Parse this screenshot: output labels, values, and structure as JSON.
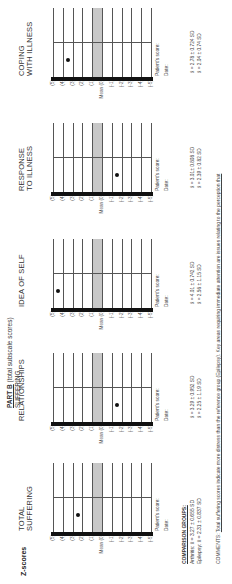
{
  "header": {
    "zscores_label": "Z-scores",
    "part_label": "PART B",
    "part_note": "(total subscale scores)",
    "section_label": "SUFFERING"
  },
  "scale": {
    "rows": [
      "(5)",
      "(4)",
      "(3)",
      "(2)",
      "(1)",
      "Mean (0)",
      "(-1)",
      "(-2)",
      "(-3)",
      "(-4)",
      "(-5)"
    ],
    "mean_highlight_color": "#c8c8c8"
  },
  "charts": [
    {
      "title1": "TOTAL",
      "title2": "SUFFERING",
      "patient_score_label": "Patient's score:",
      "date_label": "Date:",
      "dot_value": 2,
      "stat1": "",
      "stat2": ""
    },
    {
      "title1": "RELATIONSHIPS",
      "title2": "",
      "patient_score_label": "Patient's score:",
      "date_label": "Date:",
      "dot_value": -1,
      "stat1": "x̄ = 3.29 ± 0.952 SD",
      "stat2": "x̄ = 2.25 ± 1.19 SD"
    },
    {
      "title1": "IDEA OF SELF",
      "title2": "",
      "patient_score_label": "Patient's score:",
      "date_label": "Date:",
      "dot_value": 4,
      "stat1": "x̄ = 4.01 ± 0.742 SD",
      "stat2": "x̄ = 2.56 ± 1.15 SD"
    },
    {
      "title1": "RESPONSE",
      "title2": "TO ILLNESS",
      "patient_score_label": "Patient's score:",
      "date_label": "Date:",
      "dot_value": -1,
      "stat1": "x̄ = 3.01± 0.808 SD",
      "stat2": "x̄ = 2.39 ± 0.82 SD"
    },
    {
      "title1": "COPING",
      "title2": "WITH ILLNESS",
      "patient_score_label": "Patient's score:",
      "date_label": "Date:",
      "dot_value": 3,
      "stat1": "x̄ = 2.78 ± 0.724 SD",
      "stat2": "x̄ = 2.04 ± 0.74 SD"
    }
  ],
  "comparison_groups": {
    "heading": "COMPARISON GROUPS:",
    "arthritis": "Arthritis:   x̄ = 3.27 ± 0.655 SD",
    "epilepsy": "Epilepsy:  x̄ = 2.31 ± 0.837 SD"
  },
  "comments": {
    "label": "COMMENTS:",
    "text": "Total suffering scores indicate more distress than the reference group (Epilepsy). Key areas requiring immediate attention are issues relating to the perception that"
  }
}
